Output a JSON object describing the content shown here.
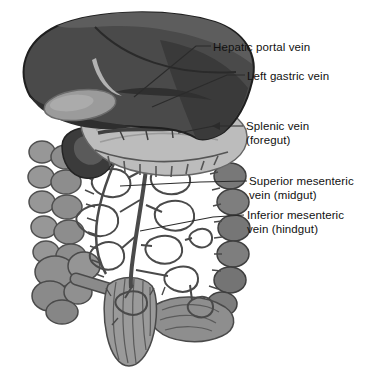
{
  "figure": {
    "type": "anatomical-diagram",
    "background_color": "#ffffff",
    "label_text_color": "#111111",
    "leader_line_color": "#2b2b2b",
    "palette": {
      "liver": "#4a4a4a",
      "liver_shadow": "#2e2e2e",
      "gallbladder": "#9b9b9b",
      "stomach": "#bcbcbc",
      "colon_left": "#949494",
      "colon_right": "#7e7e7e",
      "rectum": "#9a9a9a",
      "veins": "#4a4a4a"
    },
    "labels": [
      {
        "id": "hepatic-portal-vein",
        "line1": "Hepatic portal vein",
        "line2": ""
      },
      {
        "id": "left-gastric-vein",
        "line1": "Left gastric vein",
        "line2": ""
      },
      {
        "id": "splenic-vein",
        "line1": "Splenic vein",
        "line2": "(foregut)"
      },
      {
        "id": "superior-mesenteric-vein",
        "line1": "Superior mesenteric",
        "line2": "vein (midgut)"
      },
      {
        "id": "inferior-mesenteric-vein",
        "line1": "Inferior mesenteric",
        "line2": "vein (hindgut)"
      }
    ],
    "structures": [
      "liver",
      "gallbladder",
      "stomach",
      "hepatic portal vein",
      "left gastric vein",
      "splenic vein",
      "superior mesenteric vein",
      "inferior mesenteric vein",
      "ascending colon",
      "transverse colon",
      "descending colon",
      "cecum",
      "appendix",
      "sigmoid colon",
      "rectum",
      "mesenteric vein arcades"
    ]
  }
}
